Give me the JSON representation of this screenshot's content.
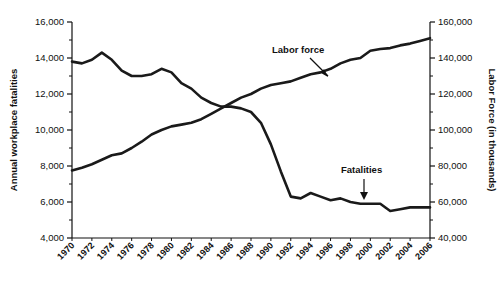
{
  "chart_data": {
    "type": "line",
    "title": "",
    "xlabel": "",
    "grid": false,
    "legend_position": "inline-annotations",
    "x": [
      1970,
      1971,
      1972,
      1973,
      1974,
      1975,
      1976,
      1977,
      1978,
      1979,
      1980,
      1981,
      1982,
      1983,
      1984,
      1985,
      1986,
      1987,
      1988,
      1989,
      1990,
      1991,
      1992,
      1993,
      1994,
      1995,
      1996,
      1997,
      1998,
      1999,
      2000,
      2001,
      2002,
      2003,
      2004,
      2005,
      2006
    ],
    "x_tick_labels": [
      "1970",
      "1972",
      "1974",
      "1976",
      "1978",
      "1980",
      "1982",
      "1984",
      "1986",
      "1988",
      "1990",
      "1992",
      "1994",
      "1996",
      "1998",
      "2000",
      "2002",
      "2004",
      "2006"
    ],
    "left_axis": {
      "label": "Annual workplace fatalities",
      "ylim": [
        4000,
        16000
      ],
      "ticks": [
        4000,
        6000,
        8000,
        10000,
        12000,
        14000,
        16000
      ],
      "tick_labels": [
        "4,000",
        "6,000",
        "8,000",
        "10,000",
        "12,000",
        "14,000",
        "16,000"
      ],
      "minor_ticks": [
        5000,
        7000,
        9000,
        11000,
        13000,
        15000
      ]
    },
    "right_axis": {
      "label": "Labor Force (in thousands)",
      "ylim": [
        40000,
        160000
      ],
      "ticks": [
        40000,
        60000,
        80000,
        100000,
        120000,
        140000,
        160000
      ],
      "tick_labels": [
        "40,000",
        "60,000",
        "80,000",
        "100,000",
        "120,000",
        "140,000",
        "160,000"
      ],
      "minor_ticks": [
        50000,
        70000,
        90000,
        110000,
        130000,
        150000
      ]
    },
    "series": [
      {
        "name": "Fatalities",
        "axis": "left",
        "color": "#1a1a1a",
        "values": [
          13800,
          13700,
          13900,
          14300,
          13900,
          13300,
          13000,
          13000,
          13100,
          13400,
          13200,
          12600,
          12300,
          11800,
          11500,
          11300,
          11300,
          11200,
          11000,
          10400,
          9200,
          7700,
          6300,
          6200,
          6500,
          6300,
          6100,
          6200,
          6000,
          5900,
          5900,
          5900,
          5500,
          5600,
          5700,
          5700,
          5700
        ]
      },
      {
        "name": "Labor force",
        "axis": "right",
        "color": "#1a1a1a",
        "values": [
          77500,
          79000,
          81000,
          83500,
          86000,
          87000,
          90000,
          93500,
          97500,
          100000,
          102000,
          103000,
          104000,
          106000,
          109000,
          112000,
          115000,
          118000,
          120000,
          123000,
          125000,
          126000,
          127000,
          129000,
          131000,
          132000,
          134000,
          137000,
          139000,
          140000,
          144000,
          145000,
          145500,
          147000,
          148000,
          149500,
          151000
        ]
      }
    ],
    "annotations": [
      {
        "text": "Labor force",
        "target_series": "Labor force"
      },
      {
        "text": "Fatalities",
        "target_series": "Fatalities"
      }
    ]
  }
}
